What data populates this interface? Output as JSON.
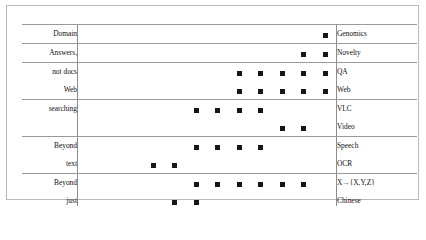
{
  "figure": {
    "title": "",
    "background": "#ffffff",
    "frame_color": "#b9b9b9",
    "rule_color": "#9a9a9a",
    "marker_color": "#161616"
  },
  "chart_data": {
    "type": "scatter",
    "title": "",
    "xlabel": "",
    "ylabel": "",
    "grid": true,
    "legend": "none",
    "x": [
      "1992",
      "1993",
      "1994",
      "1995",
      "1996",
      "1997",
      "1998",
      "1999",
      "2000",
      "2001",
      "2002",
      "2003"
    ],
    "left_labels": [
      "Domain",
      "Answers,",
      "not docs",
      "Web",
      "searching",
      "",
      "Beyond",
      "text",
      "Beyond",
      "just",
      "English",
      "Human",
      "Streamed",
      "text",
      "Static text"
    ],
    "right_labels": [
      "Genomics",
      "Novelty",
      "QA",
      "Web",
      "VLC",
      "Video",
      "Speech",
      "OCR",
      "X→{X,Y,Z}",
      "Chinese",
      "Spanish",
      "Interactive, HARD",
      "Filtering",
      "Routing",
      "Ad Hoc, Robust"
    ],
    "rows": [
      {
        "left": "Domain",
        "right": "Genomics",
        "years": [
          "2003"
        ]
      },
      {
        "left": "Answers,",
        "right": "Novelty",
        "years": [
          "2002",
          "2003"
        ]
      },
      {
        "left": "not docs",
        "right": "QA",
        "years": [
          "1999",
          "2000",
          "2001",
          "2002",
          "2003"
        ]
      },
      {
        "left": "Web",
        "right": "Web",
        "years": [
          "1999",
          "2000",
          "2001",
          "2002",
          "2003"
        ]
      },
      {
        "left": "searching",
        "right": "VLC",
        "years": [
          "1997",
          "1998",
          "1999",
          "2000"
        ]
      },
      {
        "left": "",
        "right": "Video",
        "years": [
          "2001",
          "2002"
        ]
      },
      {
        "left": "Beyond",
        "right": "Speech",
        "years": [
          "1997",
          "1998",
          "1999",
          "2000"
        ]
      },
      {
        "left": "text",
        "right": "OCR",
        "years": [
          "1995",
          "1996"
        ]
      },
      {
        "left": "Beyond",
        "right": "X→{X,Y,Z}",
        "years": [
          "1997",
          "1998",
          "1999",
          "2000",
          "2001",
          "2002"
        ]
      },
      {
        "left": "just",
        "right": "Chinese",
        "years": [
          "1996",
          "1997"
        ]
      },
      {
        "left": "English",
        "right": "Spanish",
        "years": [
          "1994",
          "1995",
          "1996"
        ]
      },
      {
        "left": "Human",
        "right": "Interactive, HARD",
        "years": [
          "1994",
          "1995",
          "1996",
          "1997",
          "1998",
          "1999",
          "2000",
          "2001",
          "2002",
          "2003"
        ]
      },
      {
        "left": "Streamed",
        "right": "Filtering",
        "years": [
          "1995",
          "1996",
          "1997",
          "1998",
          "1999",
          "2000",
          "2001",
          "2002"
        ]
      },
      {
        "left": "text",
        "right": "Routing",
        "years": [
          "1992",
          "1993",
          "1994",
          "1995",
          "1996",
          "1997"
        ]
      },
      {
        "left": "Static text",
        "right": "Ad Hoc, Robust",
        "years": [
          "1992",
          "1993",
          "1994",
          "1995",
          "1996",
          "1997",
          "1998",
          "1999",
          "2003"
        ]
      }
    ],
    "group_separators_after_rows": [
      0,
      1,
      3,
      5,
      7,
      10,
      11,
      13,
      14
    ],
    "group_separators_before_rows": [
      0
    ]
  }
}
